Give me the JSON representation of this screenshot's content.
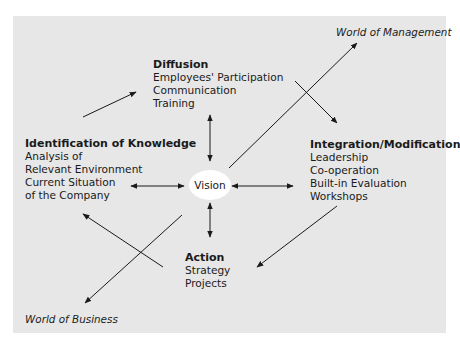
{
  "diagram": {
    "center": {
      "label": "Vision"
    },
    "nodes": {
      "diffusion": {
        "title": "Diffusion",
        "items": [
          "Employees' Participation",
          "Communication",
          "Training"
        ]
      },
      "identification": {
        "title": "Identification of Knowledge",
        "items": [
          "Analysis of",
          "Relevant Environment",
          "Current Situation",
          "of the Company"
        ]
      },
      "integration": {
        "title": "Integration/Modification",
        "items": [
          "Leadership",
          "Co-operation",
          "Built-in Evaluation",
          "Workshops"
        ]
      },
      "action": {
        "title": "Action",
        "items": [
          "Strategy",
          "Projects"
        ]
      }
    },
    "outer_labels": {
      "management": "World of Management",
      "business": "World of Business"
    },
    "colors": {
      "panel": "#e7e7e7",
      "vision_fill": "#ffffff",
      "line": "#1a1a1a"
    }
  }
}
